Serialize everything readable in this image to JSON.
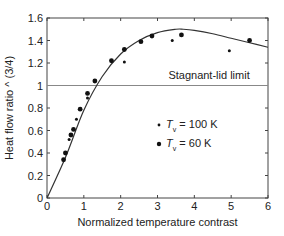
{
  "chart_data": {
    "type": "scatter",
    "title": "",
    "xlabel": "Normalized temperature contrast",
    "ylabel": "Heat flow ratio ^ (3/4)",
    "xlim": [
      0,
      6
    ],
    "ylim": [
      0,
      1.6
    ],
    "xticks": [
      0,
      1,
      2,
      3,
      4,
      5,
      6
    ],
    "xtick_labels": [
      "0",
      "1",
      "2",
      "3",
      "4",
      "5",
      "6"
    ],
    "yticks": [
      0,
      0.2,
      0.4,
      0.6,
      0.8,
      1,
      1.2,
      1.4,
      1.6
    ],
    "ytick_labels": [
      "0",
      "0.2",
      "0.4",
      "0.6",
      "0.8",
      "1",
      "1.2",
      "1.4",
      "1.6"
    ],
    "grid": false,
    "legend_position": "center-right",
    "annotations": [
      {
        "text": "Stagnant-lid limit",
        "x": 4.4,
        "y": 1.05
      }
    ],
    "reference_line": {
      "label": "Stagnant-lid limit",
      "y": 1.0
    },
    "fit_curve": {
      "x": [
        0,
        0.5,
        1.0,
        1.5,
        2.0,
        2.5,
        3.0,
        3.5,
        3.7,
        4.0,
        4.5,
        5.0,
        5.5,
        6.0
      ],
      "y": [
        0,
        0.36,
        0.78,
        1.08,
        1.28,
        1.4,
        1.47,
        1.5,
        1.5,
        1.49,
        1.46,
        1.42,
        1.38,
        1.34
      ]
    },
    "series": [
      {
        "name": "T_v = 100 K",
        "marker": "small-dot",
        "x": [
          0.6,
          0.8,
          1.1,
          2.1,
          3.4,
          4.95
        ],
        "y": [
          0.52,
          0.7,
          0.89,
          1.21,
          1.4,
          1.31
        ]
      },
      {
        "name": "T_v = 60 K",
        "marker": "dot",
        "x": [
          0.45,
          0.5,
          0.65,
          0.72,
          0.9,
          1.1,
          1.3,
          1.75,
          2.1,
          2.55,
          2.85,
          3.65,
          5.5
        ],
        "y": [
          0.34,
          0.4,
          0.56,
          0.61,
          0.79,
          0.93,
          1.04,
          1.22,
          1.32,
          1.39,
          1.44,
          1.45,
          1.4
        ]
      }
    ]
  },
  "legend": {
    "items": [
      {
        "prefix": "T",
        "sub": "v",
        "suffix": " = 100 K",
        "marker": "small-dot"
      },
      {
        "prefix": "T",
        "sub": "v",
        "suffix": " = 60 K",
        "marker": "dot"
      }
    ]
  },
  "colors": {
    "axis": "#444444",
    "curve": "#333333",
    "reference_line": "#888888",
    "points": "#111111"
  }
}
